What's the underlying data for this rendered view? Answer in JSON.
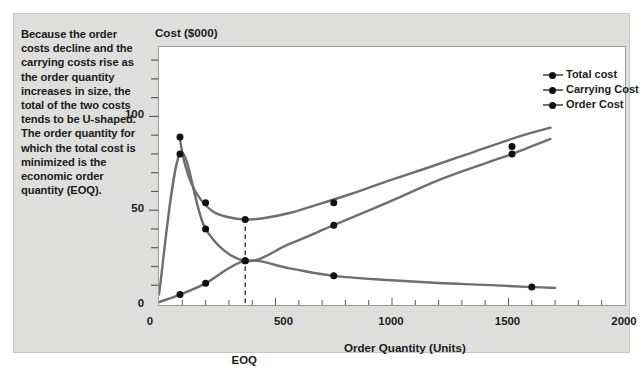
{
  "caption": {
    "text": "Because the order costs decline and the carrying costs rise as the order quantity increases in size, the total of the two costs tends to be U-shaped. The order quantity for which the total cost is minimized is the economic order quantity (EOQ)."
  },
  "colors": {
    "figure_background": "#dededd",
    "plot_background": "#ffffff",
    "curve": "#6e6e6e",
    "marker": "#111111",
    "axis": "#5a5a5a",
    "text": "#1b1b1b"
  },
  "legend": {
    "position": "top-right-inside",
    "entries": [
      {
        "label": "Total cost"
      },
      {
        "label": "Carrying Cost"
      },
      {
        "label": "Order Cost"
      }
    ]
  },
  "annotations": {
    "eoq_label": "EOQ",
    "eoq_x": 370
  },
  "chart_data": {
    "type": "line",
    "title": "",
    "ylabel": "Cost ($000)",
    "xlabel": "Order Quantity (Units)",
    "xlim": [
      0,
      2000
    ],
    "ylim": [
      0,
      137
    ],
    "grid": false,
    "x_ticks": [
      0,
      500,
      1000,
      1500,
      2000
    ],
    "x_tick_labels": [
      "0",
      "500",
      "1000",
      "1500",
      "2000"
    ],
    "x_minor_step": 100,
    "y_ticks": [
      0,
      50,
      100
    ],
    "y_tick_labels": [
      "0",
      "50",
      "100"
    ],
    "y_minor_step": 10,
    "series": [
      {
        "name": "Total cost",
        "marker_x": [
          90,
          200,
          370,
          750,
          1515
        ],
        "marker_y": [
          89,
          54,
          45,
          54,
          84
        ],
        "x": [
          88,
          110,
          140,
          180,
          230,
          290,
          370,
          460,
          560,
          680,
          820,
          980,
          1150,
          1350,
          1550,
          1680
        ],
        "y": [
          89,
          75,
          64,
          55.5,
          49.5,
          46.5,
          45,
          46,
          48.5,
          53,
          58.5,
          65.5,
          72.5,
          81,
          89.5,
          94
        ]
      },
      {
        "name": "Carrying Cost",
        "marker_x": [
          90,
          200,
          370,
          750,
          1515
        ],
        "marker_y": [
          80,
          40,
          23,
          42,
          80
        ],
        "x": [
          0,
          90,
          200,
          370,
          560,
          750,
          980,
          1200,
          1400,
          1515,
          1680
        ],
        "y": [
          5,
          80,
          40,
          23,
          32,
          42,
          54,
          66,
          75,
          80,
          88
        ]
      },
      {
        "name": "Order Cost",
        "marker_x": [
          90,
          200,
          370,
          750,
          1600
        ],
        "marker_y": [
          5,
          11,
          23,
          15,
          9
        ],
        "x": [
          0,
          90,
          200,
          370,
          560,
          750,
          980,
          1200,
          1400,
          1600,
          1700
        ],
        "y": [
          1,
          5,
          11,
          23,
          19,
          15,
          12.8,
          11.2,
          10.2,
          9,
          8.6
        ]
      }
    ]
  }
}
